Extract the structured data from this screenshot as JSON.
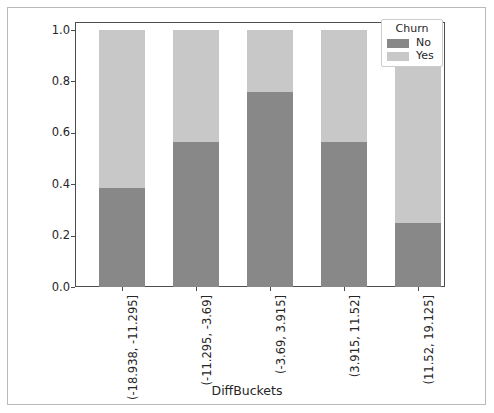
{
  "chart_data": {
    "type": "bar",
    "stacked": true,
    "normalized": true,
    "title": "",
    "xlabel": "DiffBuckets",
    "ylabel": "",
    "ylim": [
      0.0,
      1.0
    ],
    "yticks": [
      "0.0",
      "0.2",
      "0.4",
      "0.6",
      "0.8",
      "1.0"
    ],
    "ytick_values": [
      0.0,
      0.2,
      0.4,
      0.6,
      0.8,
      1.0
    ],
    "grid": false,
    "legend_position": "upper right",
    "legend_title": "Churn",
    "categories": [
      "(-18.938, -11.295]",
      "(-11.295, -3.69]",
      "(-3.69, 3.915]",
      "(3.915, 11.52]",
      "(11.52, 19.125]"
    ],
    "series": [
      {
        "name": "No",
        "color": "#888888",
        "values": [
          0.385,
          0.565,
          0.76,
          0.565,
          0.25
        ]
      },
      {
        "name": "Yes",
        "color": "#c8c8c8",
        "values": [
          0.615,
          0.435,
          0.24,
          0.435,
          0.75
        ]
      }
    ]
  },
  "figure": {
    "axes_color": "#4d4d4d",
    "border_color": "#b9b9b9",
    "background": "#ffffff",
    "text_color": "#262626"
  }
}
